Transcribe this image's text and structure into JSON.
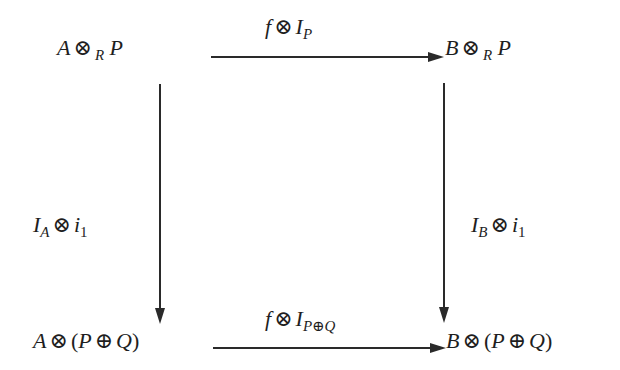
{
  "diagram": {
    "type": "commutative-square",
    "nodes": {
      "top_left": {
        "base": "A",
        "op": "⊗",
        "sub": "R",
        "rest": "P"
      },
      "top_right": {
        "base": "B",
        "op": "⊗",
        "sub": "R",
        "rest": "P"
      },
      "bottom_left": {
        "base": "A",
        "op": "⊗",
        "open": "(",
        "p": "P",
        "plus": "⊕",
        "q": "Q",
        "close": ")"
      },
      "bottom_right": {
        "base": "B",
        "op": "⊗",
        "open": "(",
        "p": "P",
        "plus": "⊕",
        "q": "Q",
        "close": ")"
      }
    },
    "arrows": {
      "top": {
        "f": "f",
        "op": "⊗",
        "I": "I",
        "sub": "P",
        "from": "A ⊗_R P",
        "to": "B ⊗_R P"
      },
      "bottom": {
        "f": "f",
        "op": "⊗",
        "I": "I",
        "sub": "P⊕Q",
        "from": "A ⊗ (P ⊕ Q)",
        "to": "B ⊗ (P ⊕ Q)"
      },
      "left": {
        "I": "I",
        "sub": "A",
        "op": "⊗",
        "i": "i",
        "isub": "1",
        "from": "A ⊗_R P",
        "to": "A ⊗ (P ⊕ Q)"
      },
      "right": {
        "I": "I",
        "sub": "B",
        "op": "⊗",
        "i": "i",
        "isub": "1",
        "from": "B ⊗_R P",
        "to": "B ⊗ (P ⊕ Q)"
      }
    },
    "colors": {
      "ink": "#1e1e1e",
      "line": "#2a2a2a",
      "background": "#ffffff"
    }
  }
}
